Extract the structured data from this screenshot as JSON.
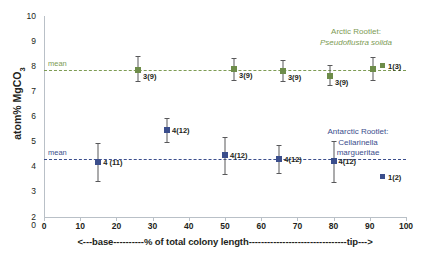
{
  "chart_data": {
    "type": "scatter",
    "title": "",
    "xlabel": "<---base----------% of total  colony length--------------------------------tip--->",
    "ylabel_text": "atom% MgCO",
    "ylabel_sub": "3",
    "xlim": [
      0,
      100
    ],
    "ylim": [
      2,
      10
    ],
    "xticks": [
      0,
      10,
      20,
      30,
      40,
      50,
      60,
      70,
      80,
      90,
      100
    ],
    "yticks": [
      2,
      3,
      4,
      5,
      6,
      7,
      8,
      9,
      10
    ],
    "grid": false,
    "mean_label": "mean",
    "series": [
      {
        "name": "Arctic Rootlet: Pseudoflustra solida",
        "color": "#6d8c49",
        "mean": 7.87,
        "legend_label": "1(3)",
        "annotation_line1": "Arctic Rootlet:",
        "annotation_line2": "Pseudoflustra solida",
        "points": [
          {
            "x": 26,
            "y": 7.87,
            "yerr_low": 7.42,
            "yerr_high": 8.42,
            "label": "3(9)"
          },
          {
            "x": 52.5,
            "y": 7.9,
            "yerr_low": 7.47,
            "yerr_high": 8.32,
            "label": "3(9)"
          },
          {
            "x": 66,
            "y": 7.82,
            "yerr_low": 7.4,
            "yerr_high": 8.25,
            "label": "3(9)"
          },
          {
            "x": 79,
            "y": 7.62,
            "yerr_low": 7.25,
            "yerr_high": 8.05,
            "label": "3(9)"
          },
          {
            "x": 91,
            "y": 7.9,
            "yerr_low": 7.47,
            "yerr_high": 8.35,
            "label": ""
          }
        ]
      },
      {
        "name": "Antarctic Rootlet: Cellarinella margueritae",
        "color": "#3b4e8c",
        "mean": 4.32,
        "legend_label": "1(2)",
        "annotation_line1": "Antarctic Rootlet:",
        "annotation_line2": "Cellarinella",
        "annotation_line3": "margueritae",
        "points": [
          {
            "x": 15,
            "y": 4.18,
            "yerr_low": 3.45,
            "yerr_high": 4.95,
            "label": "4 (11)"
          },
          {
            "x": 34,
            "y": 5.47,
            "yerr_low": 4.97,
            "yerr_high": 5.95,
            "label": "4(12)"
          },
          {
            "x": 50,
            "y": 4.47,
            "yerr_low": 3.73,
            "yerr_high": 5.18,
            "label": "4(12)"
          },
          {
            "x": 65,
            "y": 4.32,
            "yerr_low": 3.77,
            "yerr_high": 4.88,
            "label": "4(12)"
          },
          {
            "x": 80,
            "y": 4.22,
            "yerr_low": 3.4,
            "yerr_high": 5.03,
            "label": "4(12)"
          }
        ]
      }
    ]
  }
}
